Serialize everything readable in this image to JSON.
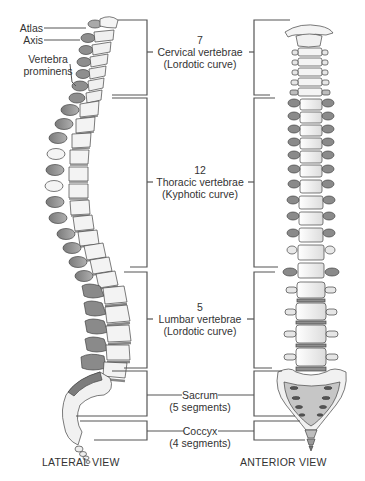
{
  "lateral_labels": {
    "atlas": "Atlas",
    "axis": "Axis",
    "vertebra_prominens_line1": "Vertebra",
    "vertebra_prominens_line2": "prominens"
  },
  "regions": [
    {
      "count": "7",
      "name": "Cervical vertebrae",
      "curve": "(Lordotic curve)"
    },
    {
      "count": "12",
      "name": "Thoracic vertebrae",
      "curve": "(Kyphotic curve)"
    },
    {
      "count": "5",
      "name": "Lumbar vertebrae",
      "curve": "(Lordotic curve)"
    },
    {
      "count": "",
      "name": "Sacrum",
      "curve": "(5 segments)"
    },
    {
      "count": "",
      "name": "Coccyx",
      "curve": "(4 segments)"
    }
  ],
  "views": {
    "lateral": "LATERAL VIEW",
    "anterior": "ANTERIOR VIEW"
  },
  "colors": {
    "line": "#555555",
    "bone_light": "#f2f2f2",
    "bone_dark": "#8a8a8a",
    "disc": "#9a9a9a"
  }
}
